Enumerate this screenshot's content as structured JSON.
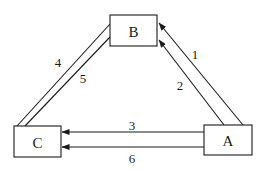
{
  "diagram": {
    "type": "directed-graph",
    "colors": {
      "stroke": "#1a1a1a",
      "background": "#ffffff"
    },
    "nodes": [
      {
        "id": "A",
        "label": "A",
        "x": 204,
        "y": 125,
        "w": 48,
        "h": 30
      },
      {
        "id": "B",
        "label": "B",
        "x": 110,
        "y": 15,
        "w": 47,
        "h": 31
      },
      {
        "id": "C",
        "label": "C",
        "x": 14,
        "y": 126,
        "w": 47,
        "h": 31
      }
    ],
    "edges": [
      {
        "id": "1",
        "label": "1",
        "from": "A",
        "to": "B",
        "arrow": "end",
        "x1": 243,
        "y1": 125,
        "x2": 159,
        "y2": 23,
        "lx": 195,
        "ly": 54
      },
      {
        "id": "2",
        "label": "2",
        "from": "A",
        "to": "B",
        "arrow": "end",
        "x1": 224,
        "y1": 125,
        "x2": 159,
        "y2": 40,
        "lx": 180,
        "ly": 85
      },
      {
        "id": "3",
        "label": "3",
        "from": "A",
        "to": "C",
        "arrow": "end",
        "x1": 204,
        "y1": 132,
        "x2": 62,
        "y2": 132,
        "lx": 132,
        "ly": 125
      },
      {
        "id": "4",
        "label": "4",
        "from": "C",
        "to": "B",
        "arrow": "none",
        "x1": 17,
        "y1": 126,
        "x2": 110,
        "y2": 24,
        "lx": 58,
        "ly": 62
      },
      {
        "id": "5",
        "label": "5",
        "from": "C",
        "to": "B",
        "arrow": "none",
        "x1": 25,
        "y1": 126,
        "x2": 110,
        "y2": 37,
        "lx": 83,
        "ly": 78
      },
      {
        "id": "6",
        "label": "6",
        "from": "A",
        "to": "C",
        "arrow": "end",
        "x1": 204,
        "y1": 147,
        "x2": 62,
        "y2": 147,
        "lx": 132,
        "ly": 158
      }
    ]
  }
}
